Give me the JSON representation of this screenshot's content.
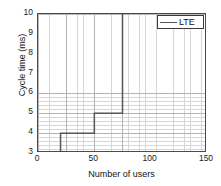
{
  "chart_data": {
    "type": "line",
    "title": "",
    "xlabel": "Number of users",
    "ylabel": "Cycle time (ms)",
    "xlim": [
      0,
      150
    ],
    "ylim": [
      3,
      10
    ],
    "xticks": [
      0,
      50,
      100,
      150
    ],
    "yticks": [
      3,
      4,
      5,
      6,
      7,
      8,
      9,
      10
    ],
    "xtick_labels": [
      "0",
      "50",
      "100",
      "150"
    ],
    "ytick_labels": [
      "3",
      "4",
      "5",
      "6",
      "7",
      "8",
      "9",
      "10"
    ],
    "grid": true,
    "grid_minor": true,
    "legend_position": "top-right",
    "series": [
      {
        "name": "LTE",
        "style": "step-post",
        "color": "#555555",
        "x": [
          0,
          20,
          20,
          50,
          50,
          75,
          75
        ],
        "y": [
          3,
          3,
          4,
          4,
          5,
          5,
          10
        ],
        "points": [
          {
            "users": 0,
            "cycle_time_ms": 3
          },
          {
            "users": 20,
            "cycle_time_ms": 3
          },
          {
            "users": 20,
            "cycle_time_ms": 4
          },
          {
            "users": 50,
            "cycle_time_ms": 4
          },
          {
            "users": 50,
            "cycle_time_ms": 5
          },
          {
            "users": 75,
            "cycle_time_ms": 5
          },
          {
            "users": 75,
            "cycle_time_ms": 10
          }
        ]
      }
    ]
  },
  "legend": {
    "entries": [
      {
        "label": "LTE",
        "color": "#555555"
      }
    ]
  },
  "colors": {
    "line": "#555555",
    "axis": "#4a4a4a",
    "grid_major": "#b0b0b0",
    "grid_minor": "#cfcfcf",
    "background": "#ffffff",
    "text": "#111111"
  }
}
